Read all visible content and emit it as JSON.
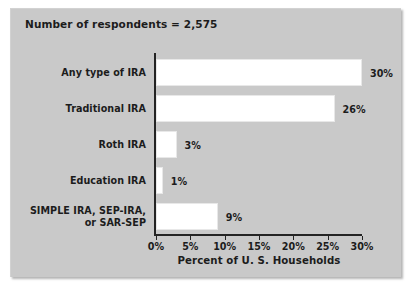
{
  "figure": {
    "note": "Number of respondents = 2,575",
    "panel_color": "#c9c9c9",
    "bar_color": "#ffffff",
    "axis_color": "#232323"
  },
  "chart_data": {
    "type": "bar",
    "orientation": "horizontal",
    "title": "",
    "subtitle": "Number of respondents = 2,575",
    "categories": [
      "Any type of IRA",
      "Traditional IRA",
      "Roth IRA",
      "Education IRA",
      "SIMPLE IRA, SEP-IRA,\nor SAR-SEP"
    ],
    "values": [
      30,
      26,
      3,
      1,
      9
    ],
    "value_labels": [
      "30%",
      "26%",
      "3%",
      "1%",
      "9%"
    ],
    "xlabel": "Percent of U. S. Households",
    "ylabel": "",
    "xlim": [
      0,
      30
    ],
    "xticks": [
      0,
      5,
      10,
      15,
      20,
      25,
      30
    ],
    "xticklabels": [
      "0%",
      "5%",
      "10%",
      "15%",
      "20%",
      "25%",
      "30%"
    ],
    "grid": false,
    "legend": null
  }
}
